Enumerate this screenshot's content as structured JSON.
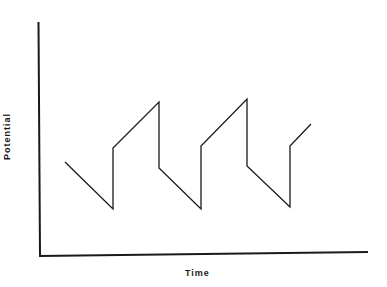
{
  "chart_data": {
    "type": "line",
    "title": "",
    "xlabel": "Time",
    "ylabel": "Potential",
    "grid": false,
    "legend": null,
    "axis_ticks": "none",
    "series": [
      {
        "name": "Potential",
        "color": "#1a1a1a",
        "points_px": [
          [
            65,
            162
          ],
          [
            113,
            209
          ],
          [
            113,
            148
          ],
          [
            159,
            102
          ],
          [
            159,
            168
          ],
          [
            201,
            209
          ],
          [
            201,
            146
          ],
          [
            247,
            99
          ],
          [
            247,
            166
          ],
          [
            290,
            207
          ],
          [
            290,
            146
          ],
          [
            311,
            124
          ]
        ]
      }
    ],
    "axes_px": {
      "origin": [
        40,
        256
      ],
      "y_top": [
        38,
        22
      ],
      "x_end": [
        368,
        252
      ]
    }
  },
  "labels": {
    "x": "Time",
    "y": "Potential"
  }
}
